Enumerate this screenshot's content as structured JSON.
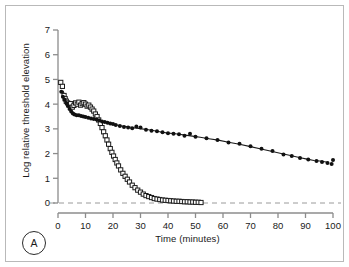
{
  "panel": {
    "label": "A"
  },
  "chart_data": {
    "type": "scatter",
    "title": "",
    "xlabel": "Time (minutes)",
    "ylabel": "Log relative threshold elevation",
    "xlim": [
      0,
      100
    ],
    "ylim": [
      0,
      7
    ],
    "xticks": [
      0,
      10,
      20,
      30,
      40,
      50,
      60,
      70,
      80,
      90,
      100
    ],
    "yticks": [
      0,
      1,
      2,
      3,
      4,
      5,
      6,
      7
    ],
    "ytick_labels": [
      "0",
      "1",
      "2",
      "3",
      "4",
      "5",
      "6",
      "7"
    ],
    "grid": false,
    "legend": "none",
    "zero_reference_line": {
      "y": 0,
      "style": "dashed",
      "color": "#9a9a9a"
    },
    "colors": {
      "marker_open": "#1a1a1a",
      "marker_filled": "#111111",
      "fit_line": "#1a1a1a",
      "axis": "#8c8c8c"
    },
    "series": [
      {
        "name": "rapid-recovery",
        "marker": "open-square",
        "fit": "exponential-decay",
        "points": [
          [
            1.0,
            4.88
          ],
          [
            1.6,
            4.72
          ],
          [
            2.2,
            4.35
          ],
          [
            2.6,
            4.22
          ],
          [
            3.0,
            4.12
          ],
          [
            3.5,
            4.05
          ],
          [
            4.0,
            3.98
          ],
          [
            4.6,
            4.02
          ],
          [
            5.2,
            3.88
          ],
          [
            5.8,
            3.95
          ],
          [
            6.4,
            4.05
          ],
          [
            7.0,
            4.0
          ],
          [
            7.6,
            4.08
          ],
          [
            8.2,
            3.96
          ],
          [
            8.8,
            4.02
          ],
          [
            9.4,
            4.06
          ],
          [
            10.0,
            4.0
          ],
          [
            10.6,
            3.92
          ],
          [
            11.2,
            3.96
          ],
          [
            11.8,
            3.88
          ],
          [
            12.4,
            3.8
          ],
          [
            13.0,
            3.72
          ],
          [
            13.6,
            3.6
          ],
          [
            14.2,
            3.5
          ],
          [
            14.8,
            3.36
          ],
          [
            15.4,
            3.22
          ],
          [
            16.0,
            3.05
          ],
          [
            16.6,
            2.88
          ],
          [
            17.2,
            2.72
          ],
          [
            17.8,
            2.55
          ],
          [
            18.4,
            2.38
          ],
          [
            19.0,
            2.2
          ],
          [
            19.6,
            2.05
          ],
          [
            20.2,
            1.9
          ],
          [
            20.8,
            1.76
          ],
          [
            21.4,
            1.62
          ],
          [
            22.0,
            1.5
          ],
          [
            22.8,
            1.34
          ],
          [
            23.6,
            1.2
          ],
          [
            24.4,
            1.08
          ],
          [
            25.2,
            0.96
          ],
          [
            26.0,
            0.85
          ],
          [
            27.0,
            0.72
          ],
          [
            28.0,
            0.62
          ],
          [
            29.0,
            0.52
          ],
          [
            30.0,
            0.44
          ],
          [
            31.0,
            0.36
          ],
          [
            32.0,
            0.3
          ],
          [
            33.0,
            0.26
          ],
          [
            34.0,
            0.22
          ],
          [
            35.0,
            0.18
          ],
          [
            36.0,
            0.16
          ],
          [
            37.0,
            0.14
          ],
          [
            38.0,
            0.12
          ],
          [
            39.0,
            0.11
          ],
          [
            40.0,
            0.1
          ],
          [
            41.0,
            0.09
          ],
          [
            42.0,
            0.08
          ],
          [
            43.0,
            0.07
          ],
          [
            44.0,
            0.07
          ],
          [
            45.0,
            0.06
          ],
          [
            46.0,
            0.05
          ],
          [
            47.0,
            0.05
          ],
          [
            48.0,
            0.04
          ],
          [
            49.0,
            0.04
          ],
          [
            50.0,
            0.03
          ],
          [
            51.0,
            0.03
          ],
          [
            52.0,
            0.02
          ]
        ]
      },
      {
        "name": "slow-recovery",
        "marker": "filled-circle",
        "fit": "slow-exponential-decay",
        "points": [
          [
            1.2,
            4.5
          ],
          [
            1.8,
            4.3
          ],
          [
            2.4,
            4.18
          ],
          [
            3.0,
            4.05
          ],
          [
            3.6,
            3.92
          ],
          [
            4.2,
            3.8
          ],
          [
            4.8,
            3.7
          ],
          [
            5.4,
            3.62
          ],
          [
            6.0,
            3.58
          ],
          [
            6.8,
            3.55
          ],
          [
            7.6,
            3.55
          ],
          [
            8.4,
            3.52
          ],
          [
            9.2,
            3.5
          ],
          [
            10.0,
            3.48
          ],
          [
            11.0,
            3.45
          ],
          [
            12.0,
            3.42
          ],
          [
            13.0,
            3.4
          ],
          [
            14.0,
            3.38
          ],
          [
            15.0,
            3.34
          ],
          [
            16.0,
            3.3
          ],
          [
            17.0,
            3.28
          ],
          [
            18.0,
            3.25
          ],
          [
            19.0,
            3.22
          ],
          [
            20.0,
            3.2
          ],
          [
            21.0,
            3.16
          ],
          [
            22.5,
            3.12
          ],
          [
            24.0,
            3.08
          ],
          [
            25.5,
            3.05
          ],
          [
            27.0,
            3.02
          ],
          [
            28.5,
            3.1
          ],
          [
            30.0,
            3.05
          ],
          [
            32.0,
            2.96
          ],
          [
            34.0,
            2.92
          ],
          [
            36.0,
            2.9
          ],
          [
            38.0,
            2.86
          ],
          [
            40.0,
            2.82
          ],
          [
            42.0,
            2.8
          ],
          [
            44.0,
            2.78
          ],
          [
            46.0,
            2.72
          ],
          [
            48.0,
            2.8
          ],
          [
            50.0,
            2.68
          ],
          [
            54.0,
            2.62
          ],
          [
            58.0,
            2.55
          ],
          [
            62.0,
            2.45
          ],
          [
            66.0,
            2.4
          ],
          [
            70.0,
            2.3
          ],
          [
            74.0,
            2.2
          ],
          [
            78.0,
            2.1
          ],
          [
            82.0,
            1.96
          ],
          [
            85.0,
            1.9
          ],
          [
            88.0,
            1.82
          ],
          [
            91.0,
            1.76
          ],
          [
            94.0,
            1.7
          ],
          [
            96.0,
            1.66
          ],
          [
            98.0,
            1.62
          ],
          [
            99.5,
            1.58
          ],
          [
            100.0,
            1.74
          ]
        ]
      }
    ]
  }
}
